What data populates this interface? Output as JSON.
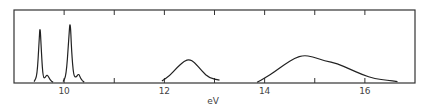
{
  "chart_data": {
    "type": "line",
    "title": "",
    "xlabel": "eV",
    "ylabel": "",
    "xlim": [
      9.0,
      17.0
    ],
    "ylim": [
      0,
      1
    ],
    "grid": false,
    "legend": null,
    "x_ticks": [
      10,
      11,
      12,
      13,
      14,
      15,
      16
    ],
    "x_tick_labels": [
      "10",
      "",
      "12",
      "",
      "14",
      "",
      "16"
    ],
    "series": [
      {
        "name": "band-1",
        "x": [
          9.4,
          9.46,
          9.5,
          9.52,
          9.55,
          9.58,
          9.62,
          9.66,
          9.72,
          9.78
        ],
        "values": [
          0.02,
          0.1,
          0.6,
          0.85,
          0.4,
          0.08,
          0.07,
          0.13,
          0.04,
          0.01
        ]
      },
      {
        "name": "band-2",
        "x": [
          9.98,
          10.04,
          10.09,
          10.12,
          10.15,
          10.19,
          10.24,
          10.29,
          10.33,
          10.4
        ],
        "values": [
          0.02,
          0.1,
          0.6,
          0.94,
          0.45,
          0.1,
          0.08,
          0.14,
          0.06,
          0.01
        ]
      },
      {
        "name": "band-3",
        "x": [
          11.95,
          12.1,
          12.25,
          12.4,
          12.5,
          12.6,
          12.75,
          12.9,
          13.1
        ],
        "values": [
          0.03,
          0.1,
          0.22,
          0.32,
          0.34,
          0.3,
          0.17,
          0.07,
          0.04
        ]
      },
      {
        "name": "band-4",
        "x": [
          13.85,
          14.0,
          14.2,
          14.4,
          14.6,
          14.78,
          14.95,
          15.2,
          15.45,
          15.7,
          15.95,
          16.2,
          16.45,
          16.65
        ],
        "values": [
          0.01,
          0.07,
          0.16,
          0.27,
          0.36,
          0.4,
          0.38,
          0.32,
          0.28,
          0.2,
          0.12,
          0.06,
          0.04,
          0.02
        ]
      }
    ]
  }
}
